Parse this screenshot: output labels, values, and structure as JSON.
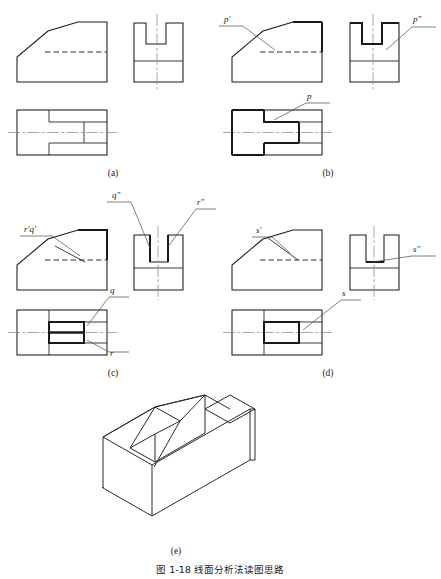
{
  "figure": {
    "caption": "图 1-18   线面分析法读图思路",
    "caption_number": "图 1-18",
    "caption_text": "线面分析法读图思路"
  },
  "panels": [
    {
      "key": "a",
      "label": "(a)",
      "description": "three orthographic views without surface annotation",
      "annotations": []
    },
    {
      "key": "b",
      "label": "(b)",
      "description": "three orthographic views with surface P highlighted",
      "annotations": [
        {
          "name": "p-front",
          "text": "p′",
          "view": "front"
        },
        {
          "name": "p-side",
          "text": "p″",
          "view": "side"
        },
        {
          "name": "p-top",
          "text": "p",
          "view": "top"
        }
      ]
    },
    {
      "key": "c",
      "label": "(c)",
      "description": "three orthographic views with surfaces Q and R highlighted",
      "annotations": [
        {
          "name": "rq-front",
          "text": "r′q′",
          "view": "front"
        },
        {
          "name": "q-side",
          "text": "q″",
          "view": "side"
        },
        {
          "name": "r-side",
          "text": "r″",
          "view": "side"
        },
        {
          "name": "q-top",
          "text": "q",
          "view": "top"
        },
        {
          "name": "r-top",
          "text": "r",
          "view": "top"
        }
      ]
    },
    {
      "key": "d",
      "label": "(d)",
      "description": "three orthographic views with surface S highlighted",
      "annotations": [
        {
          "name": "s-front",
          "text": "s′",
          "view": "front"
        },
        {
          "name": "s-side",
          "text": "s″",
          "view": "side"
        },
        {
          "name": "s-top",
          "text": "s",
          "view": "top"
        }
      ]
    },
    {
      "key": "e",
      "label": "(e)",
      "description": "isometric pictorial of the wedge block with V-groove",
      "annotations": []
    }
  ],
  "colors": {
    "line": "#1a1a1a",
    "center_line": "#8a8a8a",
    "leader": "#4a4a4a",
    "background": "#ffffff"
  }
}
